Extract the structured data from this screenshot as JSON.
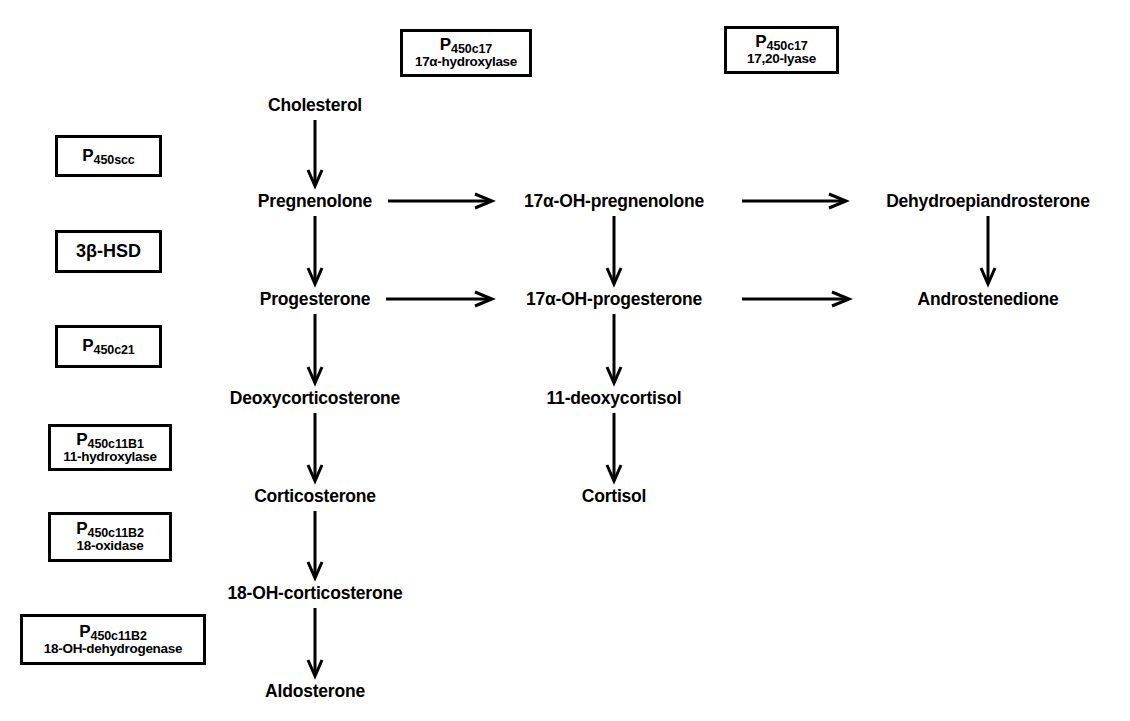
{
  "diagram": {
    "background_color": "#ffffff",
    "ink_color": "#000000"
  },
  "metabolites": [
    {
      "id": "cholesterol",
      "label": "Cholesterol",
      "x": 315,
      "y": 105
    },
    {
      "id": "pregnenolone",
      "label": "Pregnenolone",
      "x": 315,
      "y": 201
    },
    {
      "id": "progesterone",
      "label": "Progesterone",
      "x": 315,
      "y": 299
    },
    {
      "id": "deoxycorticosterone",
      "label": "Deoxycorticosterone",
      "x": 315,
      "y": 398
    },
    {
      "id": "corticosterone",
      "label": "Corticosterone",
      "x": 315,
      "y": 496
    },
    {
      "id": "18-oh-corticosterone",
      "label": "18-OH-corticosterone",
      "x": 315,
      "y": 593
    },
    {
      "id": "aldosterone",
      "label": "Aldosterone",
      "x": 315,
      "y": 691
    },
    {
      "id": "17a-oh-pregnenolone",
      "label": "17α-OH-pregnenolone",
      "x": 614,
      "y": 201
    },
    {
      "id": "17a-oh-progesterone",
      "label": "17α-OH-progesterone",
      "x": 614,
      "y": 299
    },
    {
      "id": "11-deoxycortisol",
      "label": "11-deoxycortisol",
      "x": 614,
      "y": 398
    },
    {
      "id": "cortisol",
      "label": "Cortisol",
      "x": 614,
      "y": 496
    },
    {
      "id": "dehydroepiandrosterone",
      "label": "Dehydroepiandrosterone",
      "x": 988,
      "y": 201
    },
    {
      "id": "androstenedione",
      "label": "Androstenedione",
      "x": 988,
      "y": 299
    }
  ],
  "enzymes": [
    {
      "id": "p450scc",
      "name_main": "P",
      "name_sub": "450scc",
      "name_second": "",
      "x": 55,
      "y": 135,
      "w": 107,
      "h": 42,
      "style": "sub"
    },
    {
      "id": "3b-hsd",
      "name_main": "3β-HSD",
      "name_sub": "",
      "name_second": "",
      "x": 55,
      "y": 230,
      "w": 107,
      "h": 43,
      "style": "plain"
    },
    {
      "id": "p450c21",
      "name_main": "P",
      "name_sub": "450c21",
      "name_second": "",
      "x": 55,
      "y": 325,
      "w": 107,
      "h": 43,
      "style": "sub"
    },
    {
      "id": "p450c11b1",
      "name_main": "P",
      "name_sub": "450c11B1",
      "name_second": "11-hydroxylase",
      "x": 48,
      "y": 424,
      "w": 124,
      "h": 47,
      "style": "sub2"
    },
    {
      "id": "p450c11b2-18-oxidase",
      "name_main": "P",
      "name_sub": "450c11B2",
      "name_second": "18-oxidase",
      "x": 48,
      "y": 512,
      "w": 124,
      "h": 50,
      "style": "sub2"
    },
    {
      "id": "p450c11b2-18-oh-dehydrogenase",
      "name_main": "P",
      "name_sub": "450c11B2",
      "name_second": "18-OH-dehydrogenase",
      "x": 20,
      "y": 614,
      "w": 186,
      "h": 51,
      "style": "sub2"
    },
    {
      "id": "p450c17-17a-hydroxylase",
      "name_main": "P",
      "name_sub": "450c17",
      "name_second": "17α-hydroxylase",
      "x": 400,
      "y": 29,
      "w": 132,
      "h": 48,
      "style": "sub2"
    },
    {
      "id": "p450c17-17-20-lyase",
      "name_main": "P",
      "name_sub": "450c17",
      "name_second": "17,20-lyase",
      "x": 724,
      "y": 26,
      "w": 115,
      "h": 48,
      "style": "sub2"
    }
  ],
  "arrows": [
    {
      "id": "cholesterol-to-pregnenolone",
      "dir": "v",
      "x": 315,
      "y1": 120,
      "y2": 186
    },
    {
      "id": "pregnenolone-to-progesterone",
      "dir": "v",
      "x": 315,
      "y1": 216,
      "y2": 284
    },
    {
      "id": "progesterone-to-deoxycorticosterone",
      "dir": "v",
      "x": 315,
      "y1": 314,
      "y2": 383
    },
    {
      "id": "deoxycorticosterone-to-corticosterone",
      "dir": "v",
      "x": 315,
      "y1": 413,
      "y2": 481
    },
    {
      "id": "corticosterone-to-18-oh-corticosterone",
      "dir": "v",
      "x": 315,
      "y1": 511,
      "y2": 578
    },
    {
      "id": "18-oh-corticosterone-to-aldosterone",
      "dir": "v",
      "x": 315,
      "y1": 608,
      "y2": 676
    },
    {
      "id": "pregnenolone-to-17a-oh-pregnenolone",
      "dir": "h",
      "y": 201,
      "x1": 388,
      "x2": 492
    },
    {
      "id": "progesterone-to-17a-oh-progesterone",
      "dir": "h",
      "y": 299,
      "x1": 386,
      "x2": 492
    },
    {
      "id": "17a-oh-pregnenolone-to-dhea",
      "dir": "h",
      "y": 201,
      "x1": 742,
      "x2": 846
    },
    {
      "id": "17a-oh-progesterone-to-androstenedione",
      "dir": "h",
      "y": 299,
      "x1": 742,
      "x2": 849
    },
    {
      "id": "17a-oh-pregnenolone-to-17a-oh-progesterone",
      "dir": "v",
      "x": 614,
      "y1": 216,
      "y2": 284
    },
    {
      "id": "17a-oh-progesterone-to-11-deoxycortisol",
      "dir": "v",
      "x": 614,
      "y1": 314,
      "y2": 383
    },
    {
      "id": "11-deoxycortisol-to-cortisol",
      "dir": "v",
      "x": 614,
      "y1": 413,
      "y2": 481
    },
    {
      "id": "dhea-to-androstenedione",
      "dir": "v",
      "x": 988,
      "y1": 216,
      "y2": 284
    }
  ]
}
